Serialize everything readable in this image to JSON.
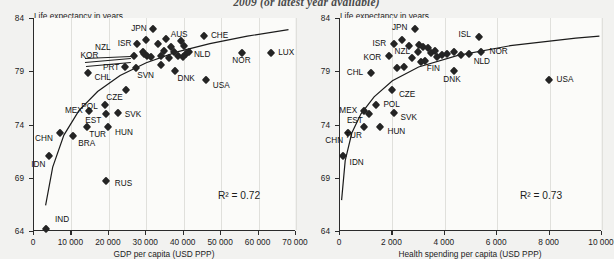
{
  "figure": {
    "suptitle": "2009 (or latest year available)"
  },
  "chart_data": [
    {
      "id": "gdp",
      "type": "scatter",
      "title": "",
      "ylabel": "Life expectancy in years",
      "xlabel": "GDP per capita (USD PPP)",
      "xlim": [
        0,
        70000
      ],
      "ylim": [
        64,
        84
      ],
      "xticks": [
        0,
        10000,
        20000,
        30000,
        40000,
        50000,
        60000,
        70000
      ],
      "xtick_labels": [
        "0",
        "10 000",
        "20 000",
        "30 000",
        "40 000",
        "50 000",
        "60 000",
        "70 000"
      ],
      "yticks": [
        64,
        69,
        74,
        79,
        84
      ],
      "ytick_labels": [
        "64",
        "69",
        "74",
        "79",
        "84"
      ],
      "grid": "vertical",
      "annotation": "R² = 0.72",
      "trendline": "logarithmic fit",
      "points": [
        {
          "label": "IND",
          "x": 3200,
          "y": 64.2,
          "lx": 9,
          "ly": -9,
          "anchor": "l"
        },
        {
          "label": "IDN",
          "x": 4100,
          "y": 71.0,
          "lx": -4,
          "ly": 9,
          "anchor": "r"
        },
        {
          "label": "CHN",
          "x": 6900,
          "y": 73.2,
          "lx": -7,
          "ly": 6,
          "anchor": "r"
        },
        {
          "label": "RUS",
          "x": 19200,
          "y": 68.7,
          "lx": 9,
          "ly": 3,
          "anchor": "l"
        },
        {
          "label": "BRA",
          "x": 10500,
          "y": 72.9,
          "lx": 5,
          "ly": 8,
          "anchor": "l"
        },
        {
          "label": "TUR",
          "x": 14200,
          "y": 73.8,
          "lx": 2,
          "ly": 8,
          "anchor": "l"
        },
        {
          "label": "MEX",
          "x": 14600,
          "y": 75.3,
          "lx": -6,
          "ly": 0,
          "anchor": "r"
        },
        {
          "label": "HUN",
          "x": 19800,
          "y": 73.8,
          "lx": 7,
          "ly": 6,
          "anchor": "l"
        },
        {
          "label": "EST",
          "x": 19300,
          "y": 75.0,
          "lx": -5,
          "ly": 7,
          "anchor": "r"
        },
        {
          "label": "POL",
          "x": 18900,
          "y": 75.8,
          "lx": -7,
          "ly": 2,
          "anchor": "r"
        },
        {
          "label": "SVK",
          "x": 22400,
          "y": 75.1,
          "lx": 7,
          "ly": 2,
          "anchor": "l"
        },
        {
          "label": "CZE",
          "x": 24500,
          "y": 77.2,
          "lx": -3,
          "ly": 8,
          "anchor": "r"
        },
        {
          "label": "CHL",
          "x": 14300,
          "y": 78.8,
          "lx": 7,
          "ly": 5,
          "anchor": "l"
        },
        {
          "label": "KOR",
          "x": 26800,
          "y": 80.4,
          "lx": -36,
          "ly": 0,
          "anchor": "r"
        },
        {
          "label": "PRT",
          "x": 24400,
          "y": 79.4,
          "lx": -6,
          "ly": 1,
          "anchor": "r"
        },
        {
          "label": "SVN",
          "x": 27300,
          "y": 79.3,
          "lx": 1,
          "ly": 8,
          "anchor": "l"
        },
        {
          "label": "ISR",
          "x": 27600,
          "y": 81.6,
          "lx": -6,
          "ly": 0,
          "anchor": "r"
        },
        {
          "label": "NZL",
          "x": 29000,
          "y": 80.8,
          "lx": -32,
          "ly": -4,
          "anchor": "r"
        },
        {
          "label": "JPN",
          "x": 31700,
          "y": 83.0,
          "lx": -6,
          "ly": 0,
          "anchor": "r"
        },
        {
          "label": "DNK",
          "x": 37800,
          "y": 79.0,
          "lx": 2,
          "ly": 8,
          "anchor": "l"
        },
        {
          "label": "AUS",
          "x": 39300,
          "y": 81.8,
          "lx": -2,
          "ly": -6,
          "anchor": "c"
        },
        {
          "label": "NLD",
          "x": 40600,
          "y": 80.6,
          "lx": 8,
          "ly": 1,
          "anchor": "l"
        },
        {
          "label": "CHE",
          "x": 45400,
          "y": 82.3,
          "lx": 7,
          "ly": 0,
          "anchor": "l"
        },
        {
          "label": "USA",
          "x": 45900,
          "y": 78.2,
          "lx": 7,
          "ly": 6,
          "anchor": "l"
        },
        {
          "label": "NOR",
          "x": 55700,
          "y": 80.7,
          "lx": -1,
          "ly": 8,
          "anchor": "c"
        },
        {
          "label": "LUX",
          "x": 63400,
          "y": 80.7,
          "lx": 7,
          "ly": 0,
          "anchor": "l"
        },
        {
          "label": "",
          "x": 30000,
          "y": 81.9,
          "lx": 0,
          "ly": 0,
          "anchor": "l"
        },
        {
          "label": "",
          "x": 29400,
          "y": 80.6,
          "lx": 0,
          "ly": 0,
          "anchor": "l"
        },
        {
          "label": "",
          "x": 30300,
          "y": 80.4,
          "lx": 0,
          "ly": 0,
          "anchor": "l"
        },
        {
          "label": "",
          "x": 31300,
          "y": 80.3,
          "lx": 0,
          "ly": 0,
          "anchor": "l"
        },
        {
          "label": "",
          "x": 33000,
          "y": 81.6,
          "lx": 0,
          "ly": 0,
          "anchor": "l"
        },
        {
          "label": "",
          "x": 33800,
          "y": 80.4,
          "lx": 0,
          "ly": 0,
          "anchor": "l"
        },
        {
          "label": "",
          "x": 34700,
          "y": 80.9,
          "lx": 0,
          "ly": 0,
          "anchor": "l"
        },
        {
          "label": "",
          "x": 35300,
          "y": 82.0,
          "lx": 0,
          "ly": 0,
          "anchor": "l"
        },
        {
          "label": "",
          "x": 36100,
          "y": 80.2,
          "lx": 0,
          "ly": 0,
          "anchor": "l"
        },
        {
          "label": "",
          "x": 36600,
          "y": 81.3,
          "lx": 0,
          "ly": 0,
          "anchor": "l"
        },
        {
          "label": "",
          "x": 37400,
          "y": 80.8,
          "lx": 0,
          "ly": 0,
          "anchor": "l"
        },
        {
          "label": "",
          "x": 38400,
          "y": 80.4,
          "lx": 0,
          "ly": 0,
          "anchor": "l"
        },
        {
          "label": "",
          "x": 39700,
          "y": 80.3,
          "lx": 0,
          "ly": 0,
          "anchor": "l"
        },
        {
          "label": "",
          "x": 40200,
          "y": 81.4,
          "lx": 0,
          "ly": 0,
          "anchor": "l"
        },
        {
          "label": "",
          "x": 41300,
          "y": 80.8,
          "lx": 0,
          "ly": 0,
          "anchor": "l"
        },
        {
          "label": "",
          "x": 34000,
          "y": 79.6,
          "lx": 0,
          "ly": 0,
          "anchor": "l"
        }
      ],
      "fit_path": [
        {
          "x": 3100,
          "y": 66.4
        },
        {
          "x": 5000,
          "y": 70.0
        },
        {
          "x": 8000,
          "y": 73.0
        },
        {
          "x": 12000,
          "y": 75.3
        },
        {
          "x": 17000,
          "y": 77.1
        },
        {
          "x": 23000,
          "y": 78.6
        },
        {
          "x": 30000,
          "y": 79.8
        },
        {
          "x": 38000,
          "y": 80.8
        },
        {
          "x": 47000,
          "y": 81.6
        },
        {
          "x": 57000,
          "y": 82.3
        },
        {
          "x": 68000,
          "y": 82.9
        }
      ]
    },
    {
      "id": "health",
      "type": "scatter",
      "title": "",
      "ylabel": "Life expectancy in years",
      "xlabel": "Health spending per capita (USD PPP)",
      "xlim": [
        0,
        10000
      ],
      "ylim": [
        64,
        84
      ],
      "xticks": [
        0,
        2000,
        4000,
        6000,
        8000,
        10000
      ],
      "xtick_labels": [
        "0",
        "2 000",
        "4 000",
        "6 000",
        "8 000",
        "10 000"
      ],
      "yticks": [
        64,
        69,
        74,
        79,
        84
      ],
      "ytick_labels": [
        "64",
        "69",
        "74",
        "79",
        "84"
      ],
      "grid": "vertical",
      "annotation": "R² = 0.73",
      "trendline": "logarithmic fit",
      "points": [
        {
          "label": "IDN",
          "x": 100,
          "y": 71.0,
          "lx": 7,
          "ly": 7,
          "anchor": "l"
        },
        {
          "label": "CHN",
          "x": 310,
          "y": 73.2,
          "lx": -5,
          "ly": 8,
          "anchor": "r"
        },
        {
          "label": "TUR",
          "x": 910,
          "y": 73.8,
          "lx": -2,
          "ly": 9,
          "anchor": "r"
        },
        {
          "label": "MEX",
          "x": 920,
          "y": 75.3,
          "lx": -7,
          "ly": 0,
          "anchor": "r"
        },
        {
          "label": "EST",
          "x": 1100,
          "y": 75.0,
          "lx": -6,
          "ly": 7,
          "anchor": "r"
        },
        {
          "label": "POL",
          "x": 1390,
          "y": 75.8,
          "lx": 7,
          "ly": 0,
          "anchor": "l"
        },
        {
          "label": "HUN",
          "x": 1510,
          "y": 73.8,
          "lx": 8,
          "ly": 5,
          "anchor": "l"
        },
        {
          "label": "SVK",
          "x": 2080,
          "y": 75.1,
          "lx": 6,
          "ly": 5,
          "anchor": "l"
        },
        {
          "label": "CZE",
          "x": 1980,
          "y": 77.2,
          "lx": 7,
          "ly": 5,
          "anchor": "l"
        },
        {
          "label": "CHL",
          "x": 1190,
          "y": 78.8,
          "lx": -8,
          "ly": 0,
          "anchor": "r"
        },
        {
          "label": "KOR",
          "x": 1880,
          "y": 80.4,
          "lx": -8,
          "ly": 2,
          "anchor": "r"
        },
        {
          "label": "ISR",
          "x": 2070,
          "y": 81.6,
          "lx": -8,
          "ly": 0,
          "anchor": "r"
        },
        {
          "label": "NZL",
          "x": 2980,
          "y": 80.8,
          "lx": -8,
          "ly": 0,
          "anchor": "r"
        },
        {
          "label": "JPN",
          "x": 2880,
          "y": 83.0,
          "lx": -8,
          "ly": -1,
          "anchor": "r"
        },
        {
          "label": "FIN",
          "x": 3230,
          "y": 80.0,
          "lx": 2,
          "ly": 8,
          "anchor": "l"
        },
        {
          "label": "DNK",
          "x": 4350,
          "y": 79.0,
          "lx": -2,
          "ly": 9,
          "anchor": "c"
        },
        {
          "label": "ISL",
          "x": 5300,
          "y": 82.2,
          "lx": -8,
          "ly": -2,
          "anchor": "r"
        },
        {
          "label": "NLD",
          "x": 4910,
          "y": 80.6,
          "lx": 5,
          "ly": 8,
          "anchor": "l"
        },
        {
          "label": "NOR",
          "x": 5400,
          "y": 80.8,
          "lx": 8,
          "ly": 0,
          "anchor": "l"
        },
        {
          "label": "USA",
          "x": 7960,
          "y": 78.2,
          "lx": 8,
          "ly": 0,
          "anchor": "l"
        },
        {
          "label": "",
          "x": 2380,
          "y": 81.9,
          "lx": 0,
          "ly": 0,
          "anchor": "l"
        },
        {
          "label": "",
          "x": 2620,
          "y": 81.4,
          "lx": 0,
          "ly": 0,
          "anchor": "l"
        },
        {
          "label": "",
          "x": 3020,
          "y": 81.5,
          "lx": 0,
          "ly": 0,
          "anchor": "l"
        },
        {
          "label": "",
          "x": 3150,
          "y": 81.3,
          "lx": 0,
          "ly": 0,
          "anchor": "l"
        },
        {
          "label": "",
          "x": 3350,
          "y": 81.2,
          "lx": 0,
          "ly": 0,
          "anchor": "l"
        },
        {
          "label": "",
          "x": 3460,
          "y": 80.7,
          "lx": 0,
          "ly": 0,
          "anchor": "l"
        },
        {
          "label": "",
          "x": 3620,
          "y": 80.9,
          "lx": 0,
          "ly": 0,
          "anchor": "l"
        },
        {
          "label": "",
          "x": 3700,
          "y": 80.3,
          "lx": 0,
          "ly": 0,
          "anchor": "l"
        },
        {
          "label": "",
          "x": 3900,
          "y": 80.5,
          "lx": 0,
          "ly": 0,
          "anchor": "l"
        },
        {
          "label": "",
          "x": 4080,
          "y": 80.6,
          "lx": 0,
          "ly": 0,
          "anchor": "l"
        },
        {
          "label": "",
          "x": 4350,
          "y": 80.8,
          "lx": 0,
          "ly": 0,
          "anchor": "l"
        },
        {
          "label": "",
          "x": 4620,
          "y": 80.5,
          "lx": 0,
          "ly": 0,
          "anchor": "l"
        },
        {
          "label": "",
          "x": 2750,
          "y": 80.2,
          "lx": 0,
          "ly": 0,
          "anchor": "l"
        },
        {
          "label": "",
          "x": 3080,
          "y": 79.9,
          "lx": 0,
          "ly": 0,
          "anchor": "l"
        },
        {
          "label": "",
          "x": 2450,
          "y": 79.4,
          "lx": 0,
          "ly": 0,
          "anchor": "l"
        },
        {
          "label": "",
          "x": 2180,
          "y": 79.3,
          "lx": 0,
          "ly": 0,
          "anchor": "l"
        }
      ],
      "fit_path": [
        {
          "x": 60,
          "y": 66.9
        },
        {
          "x": 200,
          "y": 70.6
        },
        {
          "x": 450,
          "y": 73.2
        },
        {
          "x": 800,
          "y": 75.0
        },
        {
          "x": 1300,
          "y": 76.6
        },
        {
          "x": 2000,
          "y": 78.1
        },
        {
          "x": 3000,
          "y": 79.4
        },
        {
          "x": 4500,
          "y": 80.5
        },
        {
          "x": 6500,
          "y": 81.4
        },
        {
          "x": 9000,
          "y": 82.1
        },
        {
          "x": 9900,
          "y": 82.3
        }
      ]
    }
  ],
  "leaders": {
    "left": [
      {
        "from_x": 85,
        "from_y": 58,
        "to_x": 131,
        "to_y": 56
      },
      {
        "from_x": 85,
        "from_y": 62,
        "to_x": 131,
        "to_y": 58
      },
      {
        "from_x": 86,
        "from_y": 66,
        "to_x": 131,
        "to_y": 62
      }
    ]
  }
}
